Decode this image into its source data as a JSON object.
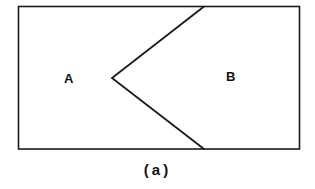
{
  "figure": {
    "caption": "(a)",
    "regions": [
      {
        "label": "A"
      },
      {
        "label": "B"
      }
    ],
    "colors": {
      "stroke": "#1a1a1a",
      "background": "#ffffff"
    }
  }
}
